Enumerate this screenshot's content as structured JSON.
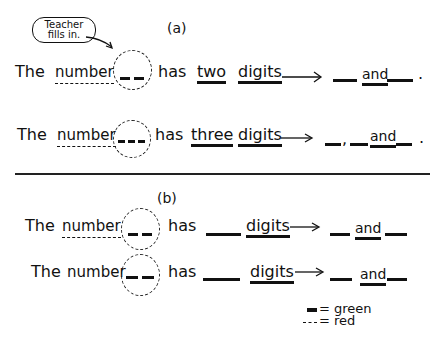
{
  "callout": {
    "line1": "Teacher",
    "line2": "fills in."
  },
  "section_a": {
    "label": "(a)",
    "rows": [
      {
        "the": "The",
        "number": "number",
        "has": "has",
        "count_word": "two",
        "digits": "digits",
        "and": "and",
        "end": "."
      },
      {
        "the": "The",
        "number": "number",
        "has": "has",
        "count_word": "three",
        "digits": "digits",
        "comma": ",",
        "and": "and",
        "end": "."
      }
    ]
  },
  "section_b": {
    "label": "(b)",
    "rows": [
      {
        "the": "The",
        "number": "number",
        "has": "has",
        "digits": "digits",
        "and": "and"
      },
      {
        "the": "The",
        "number": "number",
        "has": "has",
        "digits": "digits",
        "and": "and"
      }
    ]
  },
  "legend": {
    "solid": "= green",
    "dashed": "= red"
  },
  "colors": {
    "ink": "#111111",
    "paper": "#ffffff"
  }
}
